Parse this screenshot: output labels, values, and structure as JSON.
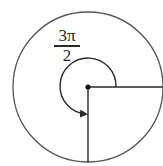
{
  "diagram": {
    "type": "unit-circle-angle",
    "angle_label": {
      "numerator": "3π",
      "denominator": "2"
    },
    "angle_radians": "3π/2",
    "direction": "counterclockwise",
    "initial_side": "positive x-axis (right)",
    "terminal_side": "negative y-axis (down)",
    "colors": {
      "stroke": "#2a2a2a",
      "background": "#ffffff"
    }
  }
}
